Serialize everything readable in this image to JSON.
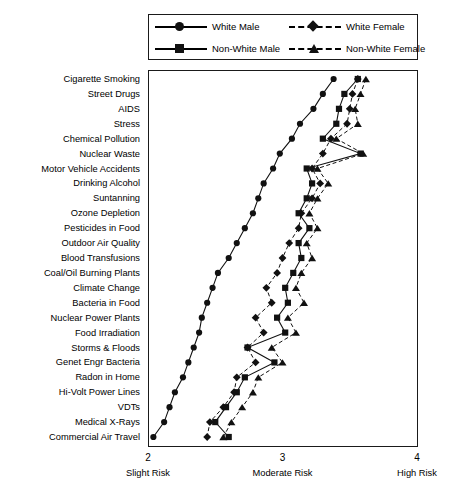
{
  "legend": {
    "entries": [
      {
        "label": "White Male",
        "marker": "circle",
        "style": "solid"
      },
      {
        "label": "White Female",
        "marker": "diamond",
        "style": "dashed"
      },
      {
        "label": "Non-White Male",
        "marker": "square",
        "style": "solid"
      },
      {
        "label": "Non-White Female",
        "marker": "triangle",
        "style": "dashed"
      }
    ]
  },
  "axis": {
    "x_ticks": [
      "2",
      "3",
      "4"
    ],
    "x_tick_labels": [
      "Slight Risk",
      "Moderate Risk",
      "High Risk"
    ]
  },
  "chart_data": {
    "type": "line",
    "title": "",
    "xlabel": "",
    "ylabel": "",
    "xlim": [
      2,
      4
    ],
    "grid": false,
    "legend_position": "top",
    "orientation": "horizontal",
    "categories": [
      "Cigarette Smoking",
      "Street Drugs",
      "AIDS",
      "Stress",
      "Chemical Pollution",
      "Nuclear Waste",
      "Motor Vehicle Accidents",
      "Drinking Alcohol",
      "Suntanning",
      "Ozone Depletion",
      "Pesticides in Food",
      "Outdoor Air Quality",
      "Blood Transfusions",
      "Coal/Oil Burning Plants",
      "Climate Change",
      "Bacteria in Food",
      "Nuclear Power Plants",
      "Food Irradiation",
      "Storms & Floods",
      "Genet Engr Bacteria",
      "Radon in Home",
      "Hi-Volt Power Lines",
      "VDTs",
      "Medical X-Rays",
      "Commercial Air Travel"
    ],
    "series": [
      {
        "name": "White Male",
        "marker": "circle",
        "style": "solid",
        "values": [
          3.38,
          3.3,
          3.23,
          3.13,
          3.07,
          2.98,
          2.93,
          2.86,
          2.82,
          2.78,
          2.72,
          2.66,
          2.6,
          2.52,
          2.48,
          2.44,
          2.4,
          2.38,
          2.34,
          2.3,
          2.26,
          2.2,
          2.16,
          2.12,
          2.04
        ]
      },
      {
        "name": "White Female",
        "marker": "diamond",
        "style": "dashed",
        "values": [
          3.56,
          3.52,
          3.5,
          3.48,
          3.36,
          3.3,
          3.22,
          3.28,
          3.22,
          3.14,
          3.12,
          3.05,
          3.0,
          2.96,
          2.88,
          2.92,
          2.8,
          2.86,
          2.74,
          2.8,
          2.66,
          2.64,
          2.56,
          2.46,
          2.44
        ]
      },
      {
        "name": "Non-White Male",
        "marker": "square",
        "style": "solid",
        "values": [
          3.56,
          3.46,
          3.42,
          3.4,
          3.3,
          3.58,
          3.18,
          3.22,
          3.18,
          3.12,
          3.2,
          3.12,
          3.14,
          3.08,
          3.02,
          3.04,
          2.96,
          3.02,
          2.74,
          2.94,
          2.72,
          2.66,
          2.58,
          2.5,
          2.6
        ]
      },
      {
        "name": "Non-White Female",
        "marker": "triangle",
        "style": "dashed",
        "values": [
          3.62,
          3.58,
          3.54,
          3.56,
          3.4,
          3.6,
          3.26,
          3.34,
          3.26,
          3.2,
          3.26,
          3.18,
          3.22,
          3.14,
          3.1,
          3.16,
          3.04,
          3.1,
          2.92,
          3.0,
          2.82,
          2.78,
          2.7,
          2.62,
          2.56
        ]
      }
    ]
  }
}
